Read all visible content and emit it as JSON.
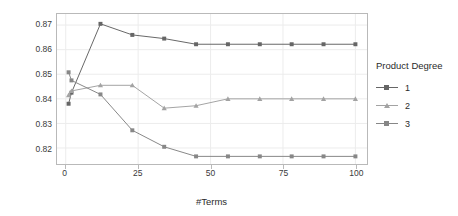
{
  "chart_data": {
    "type": "line",
    "title": "",
    "xlabel": "#Terms",
    "ylabel": "Accuracy (Cross-Validation)",
    "xlim": [
      -3,
      104
    ],
    "ylim": [
      0.8135,
      0.8745
    ],
    "xticks": [
      0,
      25,
      50,
      75,
      100
    ],
    "xticklabels": [
      "0",
      "25",
      "50",
      "75",
      "100"
    ],
    "yticks": [
      0.82,
      0.83,
      0.84,
      0.85,
      0.86,
      0.87
    ],
    "yticklabels": [
      "0.82",
      "0.83",
      "0.84",
      "0.85",
      "0.86",
      "0.87"
    ],
    "grid": true,
    "legend": {
      "title": "Product Degree",
      "position": "right",
      "entries": [
        "1",
        "2",
        "3"
      ]
    },
    "series": [
      {
        "name": "1",
        "marker": "square",
        "color": "#666666",
        "x": [
          1,
          2,
          12,
          23,
          34,
          45,
          56,
          67,
          78,
          89,
          100
        ],
        "y": [
          0.838,
          0.8425,
          0.8705,
          0.866,
          0.8645,
          0.8622,
          0.8622,
          0.8622,
          0.8622,
          0.8622,
          0.8622
        ]
      },
      {
        "name": "2",
        "marker": "triangle",
        "color": "#a3a3a3",
        "x": [
          1,
          2,
          12,
          23,
          34,
          45,
          56,
          67,
          78,
          89,
          100
        ],
        "y": [
          0.8415,
          0.8432,
          0.8455,
          0.8455,
          0.8362,
          0.8372,
          0.84,
          0.84,
          0.84,
          0.84,
          0.84
        ]
      },
      {
        "name": "3",
        "marker": "square",
        "color": "#878787",
        "x": [
          1,
          2,
          12,
          23,
          34,
          45,
          56,
          67,
          78,
          89,
          100
        ],
        "y": [
          0.8508,
          0.8475,
          0.8418,
          0.8272,
          0.8205,
          0.8166,
          0.8166,
          0.8166,
          0.8166,
          0.8166,
          0.8166
        ]
      }
    ]
  },
  "axis": {
    "y_label": "Accuracy (Cross-Validation)",
    "x_label": "#Terms"
  },
  "legend": {
    "title": "Product Degree",
    "items": [
      {
        "label": "1"
      },
      {
        "label": "2"
      },
      {
        "label": "3"
      }
    ]
  },
  "colors": {
    "series1": "#666666",
    "series2": "#a3a3a3",
    "series3": "#878787",
    "frame": "#b9b9b9",
    "grid": "#ececec",
    "text": "#2b2b2b"
  }
}
